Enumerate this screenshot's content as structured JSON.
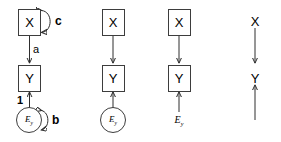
{
  "figure": {
    "background_color": "#ffffff",
    "stroke_color": "#2e2e2e",
    "node_border_color": "#3d3d3d",
    "width": 281,
    "height": 142
  },
  "panels": [
    {
      "id": "panel-1",
      "name": "full-path-diagram-with-coefficients",
      "nodes": [
        {
          "id": "x",
          "label": "X",
          "shape": "box"
        },
        {
          "id": "y",
          "label": "Y",
          "shape": "box"
        },
        {
          "id": "ey",
          "label": "E",
          "subscript": "y",
          "shape": "circle"
        }
      ],
      "edges": [
        {
          "from": "x",
          "to": "y",
          "label": "a",
          "type": "directed"
        },
        {
          "from": "ey",
          "to": "y",
          "label": "1",
          "type": "directed"
        },
        {
          "from": "x",
          "to": "x",
          "label": "c",
          "type": "self-loop-double-headed"
        },
        {
          "from": "ey",
          "to": "ey",
          "label": "b",
          "type": "self-loop-double-headed"
        }
      ]
    },
    {
      "id": "panel-2",
      "name": "path-diagram-without-coefficients",
      "nodes": [
        {
          "id": "x",
          "label": "X",
          "shape": "box"
        },
        {
          "id": "y",
          "label": "Y",
          "shape": "box"
        },
        {
          "id": "ey",
          "label": "E",
          "subscript": "y",
          "shape": "circle"
        }
      ],
      "edges": [
        {
          "from": "x",
          "to": "y",
          "label": "",
          "type": "directed"
        },
        {
          "from": "ey",
          "to": "y",
          "label": "",
          "type": "directed"
        }
      ]
    },
    {
      "id": "panel-3",
      "name": "path-diagram-plain-error-term",
      "nodes": [
        {
          "id": "x",
          "label": "X",
          "shape": "box"
        },
        {
          "id": "y",
          "label": "Y",
          "shape": "box"
        },
        {
          "id": "ey",
          "label": "E",
          "subscript": "y",
          "shape": "plain-text"
        }
      ],
      "edges": [
        {
          "from": "x",
          "to": "y",
          "label": "",
          "type": "directed"
        },
        {
          "from": "ey",
          "to": "y",
          "label": "",
          "type": "directed"
        }
      ]
    },
    {
      "id": "panel-4",
      "name": "causal-graph-bare",
      "nodes": [
        {
          "id": "x",
          "label": "X",
          "shape": "plain-text"
        },
        {
          "id": "y",
          "label": "Y",
          "shape": "plain-text"
        },
        {
          "id": "ey",
          "label": "",
          "shape": "none"
        }
      ],
      "edges": [
        {
          "from": "x",
          "to": "y",
          "label": "",
          "type": "directed"
        },
        {
          "from": "ey",
          "to": "y",
          "label": "",
          "type": "directed"
        }
      ]
    }
  ]
}
